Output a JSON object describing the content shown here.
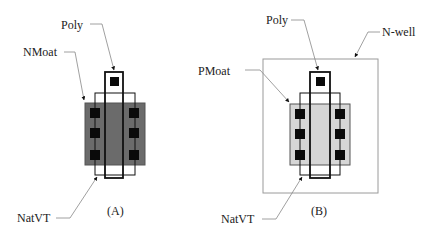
{
  "diagram_a": {
    "caption": "(A)",
    "labels": {
      "poly": "Poly",
      "moat": "NMoat",
      "natvt": "NatVT"
    },
    "moat_fill": "#6b6b6b"
  },
  "diagram_b": {
    "caption": "(B)",
    "labels": {
      "poly": "Poly",
      "moat": "PMoat",
      "natvt": "NatVT",
      "nwell": "N-well"
    },
    "moat_fill": "#d6d6d6"
  },
  "colors": {
    "outline": "#111111",
    "contact": "#0a0a0a",
    "leader": "#888888",
    "nwell": "#9a9a9a"
  }
}
